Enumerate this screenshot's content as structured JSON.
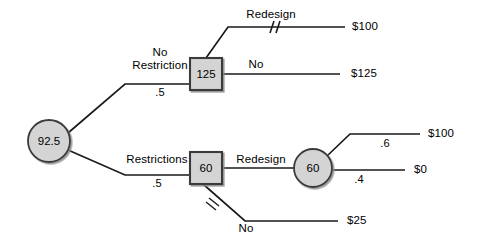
{
  "diagram": {
    "root": {
      "label": "92.5",
      "shape": "circle"
    },
    "nodes": [
      {
        "id": "root",
        "label": "92.5",
        "shape": "circle"
      },
      {
        "id": "no-restriction-decision",
        "label": "125",
        "shape": "square"
      },
      {
        "id": "restrictions-decision",
        "label": "60",
        "shape": "square"
      },
      {
        "id": "redesign-chance",
        "label": "60",
        "shape": "circle"
      }
    ],
    "branches": [
      {
        "id": "no-restriction",
        "label_line1": "No",
        "label_line2": "Restriction",
        "probability": ".5",
        "pruned": false
      },
      {
        "id": "restrictions",
        "label_line1": "Restrictions",
        "label_line2": "",
        "probability": ".5",
        "pruned": false
      },
      {
        "id": "redesign-top",
        "label_line1": "Redesign",
        "label_line2": "",
        "probability": "",
        "pruned": true
      },
      {
        "id": "no-top",
        "label_line1": "No",
        "label_line2": "",
        "probability": "",
        "pruned": false
      },
      {
        "id": "redesign-bottom",
        "label_line1": "Redesign",
        "label_line2": "",
        "probability": "",
        "pruned": false
      },
      {
        "id": "no-bottom",
        "label_line1": "No",
        "label_line2": "",
        "probability": "",
        "pruned": true
      },
      {
        "id": "chance-high",
        "label_line1": "",
        "label_line2": "",
        "probability": ".6",
        "pruned": false
      },
      {
        "id": "chance-low",
        "label_line1": "",
        "label_line2": "",
        "probability": ".4",
        "pruned": false
      }
    ],
    "payoffs": [
      {
        "id": "payoff-redesign-top",
        "value": "$100"
      },
      {
        "id": "payoff-no-top",
        "value": "$125"
      },
      {
        "id": "payoff-chance-high",
        "value": "$100"
      },
      {
        "id": "payoff-chance-low",
        "value": "$0"
      },
      {
        "id": "payoff-no-bottom",
        "value": "$25"
      }
    ],
    "colors": {
      "node_fill": "#d4d4d4",
      "node_stroke": "#3a3a3a",
      "line": "#1a1a1a",
      "text": "#000000",
      "background": "#ffffff"
    }
  }
}
